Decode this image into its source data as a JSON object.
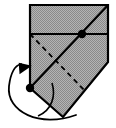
{
  "figure": {
    "caption": "",
    "background_color": "#ffffff",
    "width": 116,
    "height": 128
  },
  "colors": {
    "paper_fill": "#aaaaaa",
    "outline": "#000000",
    "fold_line": "#000000",
    "crease_line": "#000000",
    "arrow": "#000000",
    "vertex_dot": "#000000"
  },
  "shape": {
    "name": "folded-paper-polygon",
    "points": "30,5 108,5 108,62 63,117 30,88",
    "stroke_width": 2.2
  },
  "lines": {
    "horizontal_edge": {
      "name": "horizontal-fold-edge",
      "x1": 30,
      "y1": 34,
      "x2": 108,
      "y2": 34,
      "stroke_width": 2.0,
      "style": "solid"
    },
    "main_diagonal": {
      "name": "main-diagonal-fold",
      "x1": 30,
      "y1": 88,
      "x2": 108,
      "y2": 5,
      "stroke_width": 2.2,
      "style": "solid"
    },
    "dashed_crease": {
      "name": "dashed-crease-line",
      "x1": 30,
      "y1": 34,
      "x2": 86,
      "y2": 92,
      "stroke_width": 1.8,
      "style": "dashed",
      "dash_pattern": "5,4"
    }
  },
  "dots": [
    {
      "name": "upper-right-vertex-dot",
      "cx": 82,
      "cy": 34,
      "r": 4.2
    },
    {
      "name": "lower-left-vertex-dot",
      "cx": 30,
      "cy": 88,
      "r": 4.2
    }
  ],
  "arrows": {
    "fold_arrow": {
      "name": "fold-direction-arrow",
      "path": "M 76,115 C 40,128 6,112 9,86 C 11,70 17,65 21,64",
      "stroke_width": 1.8,
      "head_points": "21,62 30,72 15,72",
      "head_rotation": -35,
      "direction": "counter-clockwise-up"
    },
    "inner_arc": {
      "name": "inner-fold-arc",
      "path": "M 52,83 C 56,96 52,110 38,116",
      "stroke_width": 1.6
    }
  },
  "pattern": {
    "name": "halftone-dot-fill",
    "dot_color": "#8a8a8a",
    "base_color": "#b4b4b4",
    "spacing": 2
  }
}
